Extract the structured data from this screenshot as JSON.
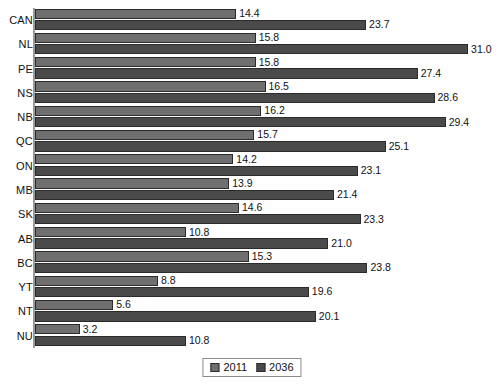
{
  "chart_data": {
    "type": "bar",
    "orientation": "horizontal",
    "title": "",
    "subtitle": "",
    "xlabel": "",
    "ylabel": "",
    "grid": false,
    "xlim": [
      0,
      31.0
    ],
    "legend_position": "bottom-center",
    "categories": [
      "CAN",
      "NL",
      "PE",
      "NS",
      "NB",
      "QC",
      "ON",
      "MB",
      "SK",
      "AB",
      "BC",
      "YT",
      "NT",
      "NU"
    ],
    "series": [
      {
        "name": "2011",
        "color": "#6f6f6f",
        "values": [
          14.4,
          15.8,
          15.8,
          16.5,
          16.2,
          15.7,
          14.2,
          13.9,
          14.6,
          10.8,
          15.3,
          8.8,
          5.6,
          3.2
        ],
        "labels": [
          "14.4",
          "15.8",
          "15.8",
          "16.5",
          "16.2",
          "15.7",
          "14.2",
          "13.9",
          "14.6",
          "10.8",
          "15.3",
          "8.8",
          "5.6",
          "3.2"
        ]
      },
      {
        "name": "2036",
        "color": "#4a4a4a",
        "values": [
          23.7,
          31.0,
          27.4,
          28.6,
          29.4,
          25.1,
          23.1,
          21.4,
          23.3,
          21.0,
          23.8,
          19.6,
          20.1,
          10.8
        ],
        "labels": [
          "23.7",
          "31.0",
          "27.4",
          "28.6",
          "29.4",
          "25.1",
          "23.1",
          "21.4",
          "23.3",
          "21.0",
          "23.8",
          "19.6",
          "20.1",
          "10.8"
        ]
      }
    ]
  },
  "legend": {
    "items": [
      {
        "label": "2011",
        "color": "#6f6f6f"
      },
      {
        "label": "2036",
        "color": "#4a4a4a"
      }
    ]
  }
}
